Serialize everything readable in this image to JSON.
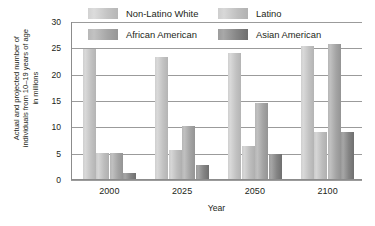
{
  "chart_data": {
    "type": "bar",
    "title": "",
    "xlabel": "Year",
    "ylabel": "Actual and projected number of\nindividuals from 10–19 years of age\nin millions",
    "categories": [
      "2000",
      "2025",
      "2050",
      "2100"
    ],
    "ylim": [
      0,
      30
    ],
    "yticks": [
      0,
      5,
      10,
      15,
      20,
      25,
      30
    ],
    "ytick_labels": [
      "0",
      "5",
      "10",
      "15",
      "20",
      "25",
      "30"
    ],
    "grid": true,
    "legend_position": "top",
    "series": [
      {
        "name": "Non-Latino White",
        "color": "#c9c9c9",
        "values": [
          24.7,
          23.2,
          23.9,
          25.3
        ]
      },
      {
        "name": "Latino",
        "color": "#c5c5c5",
        "values": [
          5.0,
          5.5,
          6.3,
          9.0
        ]
      },
      {
        "name": "African American",
        "color": "#ababab",
        "values": [
          5.0,
          10.0,
          14.5,
          25.7
        ]
      },
      {
        "name": "Asian American",
        "color": "#8a8a8a",
        "values": [
          1.2,
          2.7,
          4.7,
          9.0
        ]
      }
    ]
  },
  "legend": {
    "items": [
      {
        "label": "Non-Latino White"
      },
      {
        "label": "Latino"
      },
      {
        "label": "African American"
      },
      {
        "label": "Asian American"
      }
    ]
  }
}
